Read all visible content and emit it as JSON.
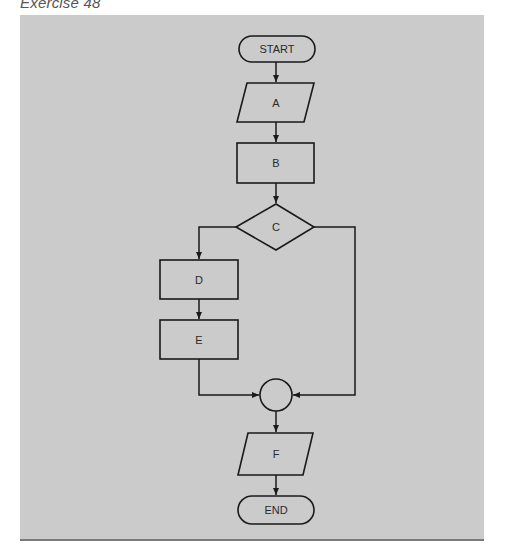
{
  "caption": "Exercise 48",
  "colors": {
    "panel_background": "#cbcbcb",
    "panel_bottom_rule": "#7a7a7a",
    "stroke": "#1a1a1a",
    "text": "#2a2a2a"
  },
  "flowchart": {
    "nodes": [
      {
        "id": "start",
        "type": "terminal",
        "label": "START"
      },
      {
        "id": "A",
        "type": "input-output",
        "label": "A"
      },
      {
        "id": "B",
        "type": "process",
        "label": "B"
      },
      {
        "id": "C",
        "type": "decision",
        "label": "C"
      },
      {
        "id": "D",
        "type": "process",
        "label": "D"
      },
      {
        "id": "E",
        "type": "process",
        "label": "E"
      },
      {
        "id": "join",
        "type": "connector",
        "label": ""
      },
      {
        "id": "F",
        "type": "input-output",
        "label": "F"
      },
      {
        "id": "end",
        "type": "terminal",
        "label": "END"
      }
    ],
    "edges": [
      {
        "from": "start",
        "to": "A"
      },
      {
        "from": "A",
        "to": "B"
      },
      {
        "from": "B",
        "to": "C"
      },
      {
        "from": "C",
        "to": "D",
        "exit": "left"
      },
      {
        "from": "C",
        "to": "join",
        "exit": "right"
      },
      {
        "from": "D",
        "to": "E"
      },
      {
        "from": "E",
        "to": "join"
      },
      {
        "from": "join",
        "to": "F"
      },
      {
        "from": "F",
        "to": "end"
      }
    ]
  }
}
